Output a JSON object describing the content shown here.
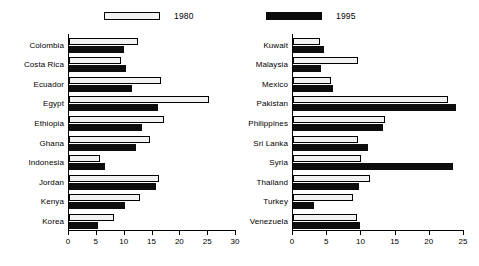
{
  "legend": {
    "entries": [
      {
        "label": "1980",
        "style": "white",
        "color": "#f2f2f2"
      },
      {
        "label": "1995",
        "style": "black",
        "color": "#0d0d0d"
      }
    ]
  },
  "chart_data": [
    {
      "type": "bar",
      "orientation": "horizontal",
      "panel": "left",
      "title": "",
      "xlabel": "",
      "ylabel": "",
      "xlim": [
        0,
        30
      ],
      "xticks": [
        0,
        5,
        10,
        15,
        20,
        25,
        30
      ],
      "ticklabels": [
        "0",
        "5",
        "10",
        "15",
        "20",
        "25",
        "30"
      ],
      "grid": false,
      "legend_position": "top",
      "categories": [
        "Colombia",
        "Costa Rica",
        "Ecuador",
        "Egypt",
        "Ethiopia",
        "Ghana",
        "Indonesia",
        "Jordan",
        "Kenya",
        "Korea"
      ],
      "series": [
        {
          "name": "1980",
          "values": [
            12.4,
            9.3,
            16.5,
            25.1,
            17.0,
            14.6,
            5.5,
            16.1,
            12.8,
            8.0
          ]
        },
        {
          "name": "1995",
          "values": [
            9.8,
            10.3,
            11.4,
            16.0,
            13.2,
            12.0,
            6.5,
            15.6,
            10.0,
            5.2
          ]
        }
      ]
    },
    {
      "type": "bar",
      "orientation": "horizontal",
      "panel": "right",
      "title": "",
      "xlabel": "",
      "ylabel": "",
      "xlim": [
        0,
        25
      ],
      "xticks": [
        0,
        5,
        10,
        15,
        20,
        25
      ],
      "ticklabels": [
        "0",
        "5",
        "10",
        "15",
        "20",
        "25"
      ],
      "grid": false,
      "legend_position": "top",
      "categories": [
        "Kuwait",
        "Malaysia",
        "Mexico",
        "Pakistan",
        "Philippines",
        "Sri Lanka",
        "Syria",
        "Thailand",
        "Turkey",
        "Venezuela"
      ],
      "series": [
        {
          "name": "1980",
          "values": [
            4.0,
            9.5,
            5.6,
            22.6,
            13.4,
            9.5,
            10.0,
            11.3,
            8.8,
            9.3
          ]
        },
        {
          "name": "1995",
          "values": [
            4.6,
            4.1,
            5.9,
            23.9,
            13.1,
            10.9,
            23.4,
            9.7,
            3.0,
            9.8
          ]
        }
      ]
    }
  ]
}
